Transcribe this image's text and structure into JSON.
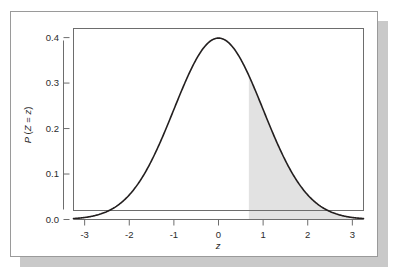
{
  "figure": {
    "background_color": "#ffffff",
    "frame_border_color": "#9a9a9a",
    "shadow_color": "#c9c9c9"
  },
  "chart_data": {
    "type": "area",
    "title": "",
    "subtitle": "",
    "xlabel": "z",
    "ylabel": "P (Z = z)",
    "xlim": [
      -3.25,
      3.25
    ],
    "ylim": [
      0.0,
      0.42
    ],
    "grid": false,
    "legend": null,
    "curve_color": "#231f1f",
    "shade_color": "#e2e2e2",
    "x_ticks": [
      -3,
      -2,
      -1,
      0,
      1,
      2,
      3
    ],
    "x_tick_labels": [
      "-3",
      "-2",
      "-1",
      "0",
      "1",
      "2",
      "3"
    ],
    "y_ticks": [
      0.0,
      0.1,
      0.2,
      0.3,
      0.4
    ],
    "y_tick_labels": [
      "0.0",
      "0.1",
      "0.2",
      "0.3",
      "0.4"
    ],
    "distribution": "standard normal (mean 0, sd 1)",
    "shaded_from": 0.68,
    "shaded_to": 3.25,
    "shaded_description": "upper tail area to the right of z = 0.68",
    "x": [
      -3.25,
      -3.0,
      -2.75,
      -2.5,
      -2.25,
      -2.0,
      -1.75,
      -1.5,
      -1.25,
      -1.0,
      -0.75,
      -0.5,
      -0.25,
      0.0,
      0.25,
      0.5,
      0.68,
      0.75,
      1.0,
      1.25,
      1.5,
      1.75,
      2.0,
      2.25,
      2.5,
      2.75,
      3.0,
      3.25
    ],
    "y": [
      0.002,
      0.0044,
      0.0091,
      0.0175,
      0.0317,
      0.054,
      0.0863,
      0.1295,
      0.1826,
      0.242,
      0.3011,
      0.3521,
      0.3867,
      0.3989,
      0.3867,
      0.3521,
      0.3166,
      0.3011,
      0.242,
      0.1826,
      0.1295,
      0.0863,
      0.054,
      0.0317,
      0.0175,
      0.0091,
      0.0044,
      0.002
    ]
  },
  "axis": {
    "x_label": "z",
    "y_label": "P (Z = z)",
    "y_label_parts": {
      "p": "P",
      "open": "(",
      "z_cap": "Z",
      "equals": "=",
      "z_low": "z",
      "close": ")"
    }
  }
}
